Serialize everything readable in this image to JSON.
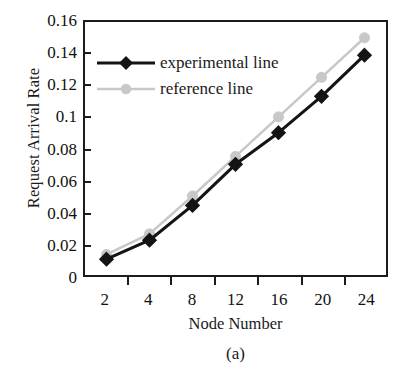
{
  "chart_data": {
    "type": "line",
    "title": "",
    "caption": "(a)",
    "xlabel": "Node Number",
    "ylabel": "Request Arrival Rate",
    "categories": [
      "2",
      "4",
      "8",
      "12",
      "16",
      "20",
      "24"
    ],
    "x_values": [
      2,
      4,
      8,
      12,
      16,
      20,
      24
    ],
    "ylim": [
      0,
      0.16
    ],
    "yticks": [
      "0.16",
      "0.14",
      "0.12",
      "0.1",
      "0.08",
      "0.06",
      "0.04",
      "0.02",
      "0"
    ],
    "ytick_values": [
      0.16,
      0.14,
      0.12,
      0.1,
      0.08,
      0.06,
      0.04,
      0.02,
      0
    ],
    "grid": false,
    "legend_position": "upper-left-inside",
    "series": [
      {
        "name": "experimental line",
        "color": "#141414",
        "marker": "diamond",
        "values": [
          0.01,
          0.022,
          0.044,
          0.07,
          0.09,
          0.113,
          0.139
        ]
      },
      {
        "name": "reference line",
        "color": "#c8c8c8",
        "marker": "circle",
        "values": [
          0.013,
          0.026,
          0.05,
          0.075,
          0.1,
          0.125,
          0.15
        ]
      }
    ]
  },
  "axes": {
    "frame_color": "#1c1c1c",
    "text_color": "#111111"
  }
}
